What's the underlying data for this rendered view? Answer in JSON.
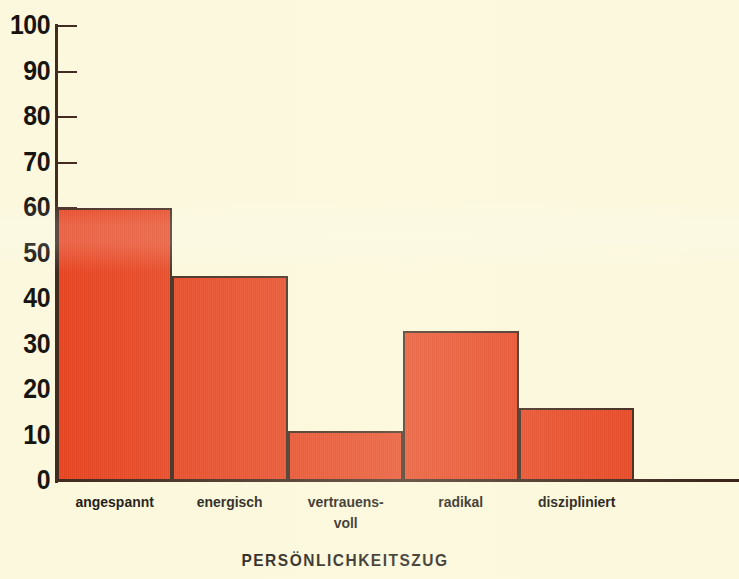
{
  "chart_data": {
    "type": "bar",
    "title": "",
    "subtitle": "",
    "xlabel": "PERSÖNLICHKEITSZUG",
    "ylabel": "",
    "categories": [
      "angespannt",
      "energisch",
      "vertrauens-voll",
      "radikal",
      "diszipliniert"
    ],
    "category_lines": [
      [
        "angespannt"
      ],
      [
        "energisch"
      ],
      [
        "vertrauens-",
        "voll"
      ],
      [
        "radikal"
      ],
      [
        "diszipliniert"
      ]
    ],
    "values": [
      60,
      45,
      11,
      33,
      16
    ],
    "ylim": [
      0,
      100
    ],
    "y_ticks": [
      0,
      10,
      20,
      30,
      40,
      50,
      60,
      70,
      80,
      90,
      100
    ],
    "y_tick_labels": [
      "0",
      "10",
      "20",
      "30",
      "40",
      "50",
      "60",
      "70",
      "80",
      "90",
      "100"
    ],
    "grid": false,
    "legend": null,
    "bar_color": "#e8401c",
    "bar_edge_color": "#3b2319",
    "background_color": "#fbf8dd",
    "text_color": "#14100c",
    "bars_adjacent": true
  }
}
